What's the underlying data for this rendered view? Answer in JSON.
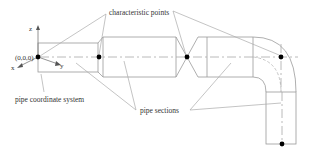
{
  "diagram": {
    "labels": {
      "characteristic_points": "characteristic points",
      "pipe_coordinate_system": "pipe coordinate system",
      "pipe_sections": "pipe sections",
      "origin": "(0,0,0)",
      "axis_z": "z",
      "axis_y": "y",
      "axis_x": "x"
    },
    "characteristic_points": [
      {
        "id": "origin",
        "x": 38,
        "y": 57
      },
      {
        "id": "reducer-start",
        "x": 99,
        "y": 57
      },
      {
        "id": "valve-center",
        "x": 187,
        "y": 57
      },
      {
        "id": "elbow-center",
        "x": 281,
        "y": 57
      },
      {
        "id": "pipe-end",
        "x": 282,
        "y": 144
      }
    ],
    "colors": {
      "lines": "#9a9a9a",
      "points": "#000000",
      "text": "#333333"
    }
  }
}
